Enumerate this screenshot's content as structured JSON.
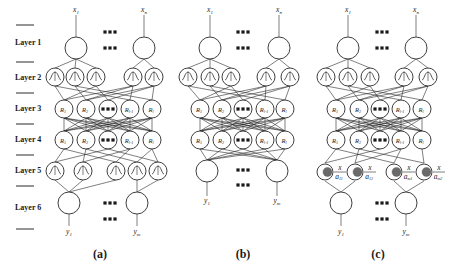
{
  "figure": {
    "layer_labels": [
      "Layer 1",
      "Layer 2",
      "Layer 3",
      "Layer 4",
      "Layer 5",
      "Layer 6"
    ],
    "panels": [
      {
        "caption": "(a)",
        "inputs": [
          "x1",
          "xn"
        ],
        "outputs": [
          "y1",
          "ym"
        ],
        "layer3_nodes": [
          "R1",
          "R2",
          "...",
          "Rl-1",
          "Rl"
        ],
        "layer4_nodes": [
          "R1",
          "R2",
          "...",
          "Rl-1",
          "Rl"
        ],
        "layers": 6
      },
      {
        "caption": "(b)",
        "inputs": [
          "x1",
          "xn"
        ],
        "outputs": [
          "y1",
          "ym"
        ],
        "layer3_nodes": [
          "R1",
          "R2",
          "...",
          "Rl-1",
          "Rl"
        ],
        "layer4_nodes": [
          "R1",
          "R2",
          "...",
          "Rl-1",
          "Rl"
        ],
        "layers": 5
      },
      {
        "caption": "(c)",
        "inputs": [
          "x1",
          "xn"
        ],
        "outputs": [
          "y1",
          "ym"
        ],
        "layer3_nodes": [
          "R1",
          "R2",
          "...",
          "Rl-1",
          "Rl"
        ],
        "layer4_nodes": [
          "R1",
          "R2",
          "...",
          "Rl-1",
          "Rl"
        ],
        "layer5_fractions": [
          {
            "num": "x",
            "den": "a11"
          },
          {
            "num": "x",
            "den": "a12"
          },
          {
            "num": "x",
            "den": "am1"
          },
          {
            "num": "x",
            "den": "am2"
          }
        ],
        "layers": 6
      }
    ],
    "ellipsis": "▪▪▪"
  }
}
